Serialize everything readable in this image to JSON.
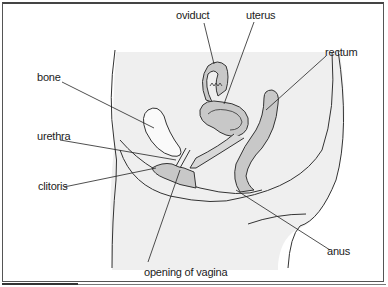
{
  "diagram": {
    "colors": {
      "body_fill": "#efefef",
      "organ_fill": "#c8c8c8",
      "outline": "#333333",
      "border": "#555555"
    },
    "labels": {
      "oviduct": "oviduct",
      "uterus": "uterus",
      "rectum": "rectum",
      "bone": "bone",
      "urethra": "urethra",
      "clitoris": "clitoris",
      "anus": "anus",
      "opening_of_vagina": "opening of vagina"
    }
  }
}
